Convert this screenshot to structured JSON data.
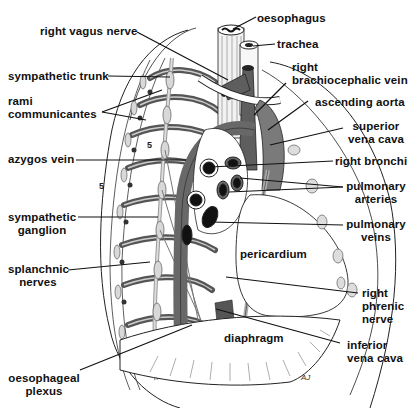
{
  "diagram": {
    "colors": {
      "ink": "#111111",
      "vessel_dark": "#5a5a5a",
      "vessel_mid": "#7a7a7a",
      "nerve_light": "#c8c8c8",
      "hatch": "#d4d4d4",
      "background": "#ffffff"
    },
    "labels_left": [
      {
        "id": "right-vagus-nerve",
        "text": "right vagus nerve"
      },
      {
        "id": "sympathetic-trunk",
        "text": "sympathetic trunk"
      },
      {
        "id": "rami-communicantes",
        "lines": [
          "rami",
          "communicantes"
        ]
      },
      {
        "id": "azygos-vein",
        "text": "azygos vein"
      },
      {
        "id": "sympathetic-ganglion",
        "lines": [
          "sympathetic",
          "ganglion"
        ]
      },
      {
        "id": "splanchnic-nerves",
        "lines": [
          "splanchnic",
          "nerves"
        ]
      },
      {
        "id": "oesophageal-plexus",
        "lines": [
          "oesophageal",
          "plexus"
        ]
      }
    ],
    "labels_right": [
      {
        "id": "oesophagus",
        "text": "oesophagus"
      },
      {
        "id": "trachea",
        "text": "trachea"
      },
      {
        "id": "right-brachiocephalic-vein",
        "lines": [
          "right",
          "brachiocephalic vein"
        ]
      },
      {
        "id": "ascending-aorta",
        "text": "ascending aorta"
      },
      {
        "id": "superior-vena-cava",
        "lines": [
          "superior",
          "vena cava"
        ]
      },
      {
        "id": "right-bronchi",
        "text": "right bronchi"
      },
      {
        "id": "pulmonary-arteries",
        "lines": [
          "pulmonary",
          "arteries"
        ]
      },
      {
        "id": "pulmonary-veins",
        "lines": [
          "pulmonary",
          "veins"
        ]
      },
      {
        "id": "right-phrenic-nerve",
        "lines": [
          "right",
          "phrenic",
          "nerve"
        ]
      },
      {
        "id": "inferior-vena-cava",
        "lines": [
          "inferior",
          "vena cava"
        ]
      }
    ],
    "labels_inside": [
      {
        "id": "pericardium",
        "text": "pericardium"
      },
      {
        "id": "diaphragm",
        "text": "diaphragm"
      }
    ],
    "rib_markers": [
      "5",
      "5"
    ],
    "signature": "AJ"
  }
}
